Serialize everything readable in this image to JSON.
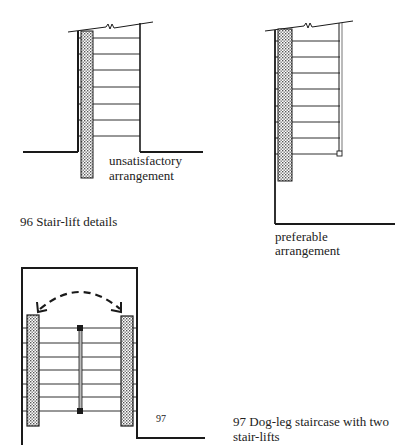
{
  "figure_96": {
    "caption": "96 Stair-lift details",
    "left_panel": {
      "label_line1": "unsatisfactory",
      "label_line2": "arrangement",
      "tread_count": 7
    },
    "right_panel": {
      "label_line1": "preferable",
      "label_line2": "arrangement",
      "tread_count": 8
    }
  },
  "figure_97": {
    "number": "97",
    "caption_line1": "97 Dog-leg staircase with two",
    "caption_line2": "stair-lifts",
    "tread_count": 7
  },
  "colors": {
    "line": "#1a1a1a",
    "stipple": "#9a9a9a",
    "background": "#ffffff"
  }
}
